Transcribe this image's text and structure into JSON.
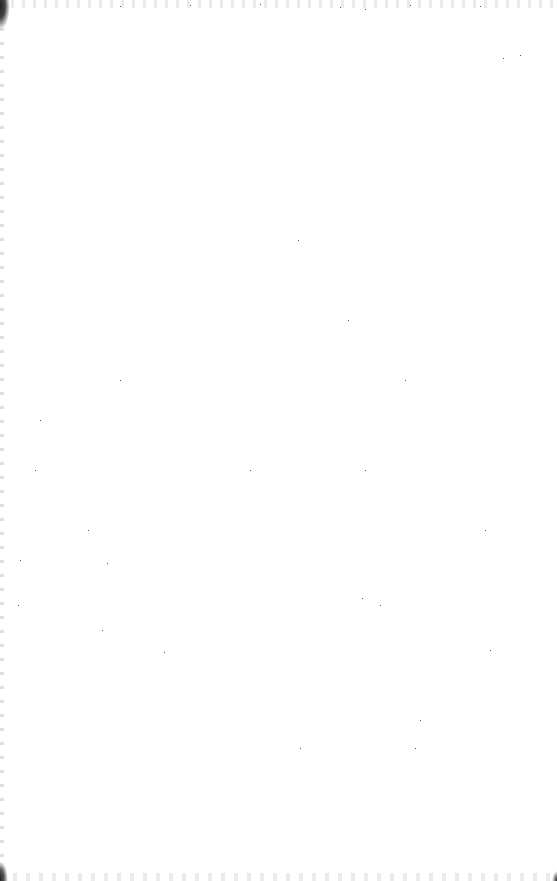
{
  "page": {
    "type": "blank-scanned-page",
    "background_color": "#ffffff"
  },
  "specks": [
    [
      120,
      6
    ],
    [
      190,
      5
    ],
    [
      260,
      4
    ],
    [
      340,
      7
    ],
    [
      410,
      5
    ],
    [
      480,
      6
    ],
    [
      365,
      9
    ],
    [
      520,
      55
    ],
    [
      503,
      58
    ],
    [
      298,
      240
    ],
    [
      348,
      320
    ],
    [
      120,
      380
    ],
    [
      405,
      380
    ],
    [
      35,
      470
    ],
    [
      250,
      470
    ],
    [
      365,
      470
    ],
    [
      88,
      530
    ],
    [
      485,
      530
    ],
    [
      107,
      563
    ],
    [
      18,
      605
    ],
    [
      362,
      598
    ],
    [
      380,
      605
    ],
    [
      102,
      630
    ],
    [
      490,
      650
    ],
    [
      164,
      652
    ],
    [
      420,
      720
    ],
    [
      300,
      748
    ],
    [
      415,
      748
    ],
    [
      20,
      560
    ],
    [
      40,
      420
    ]
  ]
}
